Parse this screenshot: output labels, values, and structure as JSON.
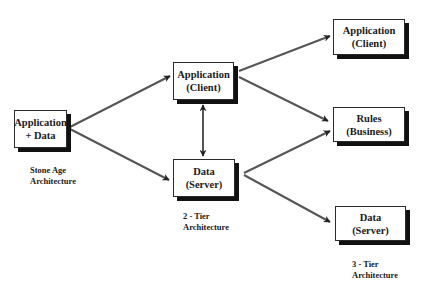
{
  "diagram": {
    "type": "architecture-evolution",
    "nodes": [
      {
        "id": "stone-app-data",
        "line1": "Application",
        "line2": "+ Data"
      },
      {
        "id": "two-tier-client",
        "line1": "Application",
        "line2": "(Client)"
      },
      {
        "id": "two-tier-server",
        "line1": "Data",
        "line2": "(Server)"
      },
      {
        "id": "three-tier-client",
        "line1": "Application",
        "line2": "(Client)"
      },
      {
        "id": "three-tier-business",
        "line1": "Rules",
        "line2": "(Business)"
      },
      {
        "id": "three-tier-server",
        "line1": "Data",
        "line2": "(Server)"
      }
    ],
    "captions": [
      {
        "id": "stone-age",
        "line1": "Stone Age",
        "line2": "Architecture"
      },
      {
        "id": "two-tier",
        "line1": "2 - Tier",
        "line2": "Architecture"
      },
      {
        "id": "three-tier",
        "line1": "3 - Tier",
        "line2": "Architecture"
      }
    ],
    "edges": [
      {
        "from": "stone-app-data",
        "to": "two-tier-client",
        "style": "arrow"
      },
      {
        "from": "stone-app-data",
        "to": "two-tier-server",
        "style": "arrow"
      },
      {
        "from": "two-tier-client",
        "to": "two-tier-server",
        "style": "bidirectional"
      },
      {
        "from": "two-tier-client",
        "to": "three-tier-client",
        "style": "arrow"
      },
      {
        "from": "two-tier-client",
        "to": "three-tier-business",
        "style": "arrow"
      },
      {
        "from": "two-tier-server",
        "to": "three-tier-business",
        "style": "arrow"
      },
      {
        "from": "two-tier-server",
        "to": "three-tier-server",
        "style": "arrow"
      }
    ],
    "colors": {
      "box_border": "#2a2a2a",
      "box_shadow": "#111111",
      "arrow": "#555555",
      "background": "#ffffff"
    }
  }
}
